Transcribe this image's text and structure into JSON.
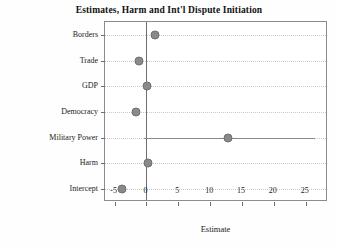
{
  "chart_data": {
    "type": "scatter",
    "title": "Estimates, Harm and Int'l Dispute Initiation",
    "xlabel": "Estimate",
    "ylabel": "",
    "xlim": [
      -6.5,
      28.5
    ],
    "xticks": [
      -5,
      0,
      5,
      10,
      15,
      20,
      25
    ],
    "xticklabels": [
      "-5",
      "0",
      "5",
      "10",
      "15",
      "20",
      "25"
    ],
    "grid": true,
    "legend": null,
    "reference_line": 0,
    "categories": [
      "Borders",
      "Trade",
      "GDP",
      "Democracy",
      "Military Power",
      "Harm",
      "Intercept"
    ],
    "points": [
      {
        "label": "Borders",
        "estimate": 1.4,
        "ci_low": 1.4,
        "ci_high": 1.4
      },
      {
        "label": "Trade",
        "estimate": -1.2,
        "ci_low": -1.2,
        "ci_high": -1.2
      },
      {
        "label": "GDP",
        "estimate": 0.1,
        "ci_low": 0.1,
        "ci_high": 0.1
      },
      {
        "label": "Democracy",
        "estimate": -1.7,
        "ci_low": -1.7,
        "ci_high": -1.7
      },
      {
        "label": "Military Power",
        "estimate": 12.8,
        "ci_low": -0.4,
        "ci_high": 26.4
      },
      {
        "label": "Harm",
        "estimate": 0.2,
        "ci_low": 0.2,
        "ci_high": 0.2
      },
      {
        "label": "Intercept",
        "estimate": -3.8,
        "ci_low": -3.8,
        "ci_high": -3.8
      }
    ],
    "colors": {
      "point": "#8a8a8a",
      "line": "#8a8a8a",
      "grid": "#c9c9c9",
      "axis": "#6e6e6e",
      "background": "#ffffff"
    }
  }
}
